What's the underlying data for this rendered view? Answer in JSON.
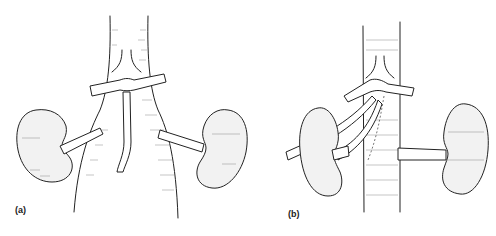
{
  "figure": {
    "panels": [
      {
        "id": "a",
        "label": "(a)",
        "description": "Two kidneys with renal vessels joining a central vessel trunk; horizontal crossing vessel above with descending branch"
      },
      {
        "id": "b",
        "label": "(b)",
        "description": "Two kidneys; left kidney with vessel crossing obliquely, right kidney joined by short vessel to central trunk"
      }
    ]
  },
  "colors": {
    "ink": "#222222",
    "hatch": "#888888",
    "background": "#ffffff"
  }
}
